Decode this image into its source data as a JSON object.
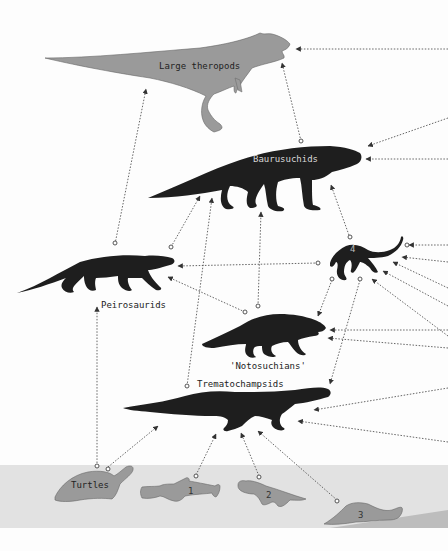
{
  "colors": {
    "background": "#fdfdfd",
    "aquatic_band": "#e2e2e2",
    "silhouette_dark": "#1e1e1e",
    "silhouette_gray": "#9a9a9a",
    "arrow": "#555555"
  },
  "labels": {
    "large_theropods": "Large theropods",
    "baurusuchids": "Baurusuchids",
    "peirosaurids": "Peirosaurids",
    "notosuchians": "'Notosuchians'",
    "trematochampsids": "Trematochampsids",
    "turtles": "Turtles",
    "taxon_1": "1",
    "taxon_2": "2",
    "taxon_3": "3",
    "taxon_4": "4"
  }
}
